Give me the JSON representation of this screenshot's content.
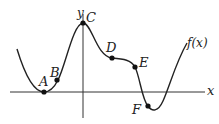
{
  "diagram": {
    "axes": {
      "x_label": "x",
      "y_label": "y"
    },
    "curve": {
      "label": "f(x)",
      "color": "#222222"
    },
    "points": [
      {
        "name": "A",
        "label": "A",
        "description": "local minimum on x-axis"
      },
      {
        "name": "B",
        "label": "B",
        "description": "point on rising part"
      },
      {
        "name": "C",
        "label": "C",
        "description": "local maximum on y-axis"
      },
      {
        "name": "D",
        "label": "D",
        "description": "point on flattening part"
      },
      {
        "name": "E",
        "label": "E",
        "description": "point on decreasing part"
      },
      {
        "name": "F",
        "label": "F",
        "description": "point near local minimum below x-axis"
      }
    ]
  }
}
